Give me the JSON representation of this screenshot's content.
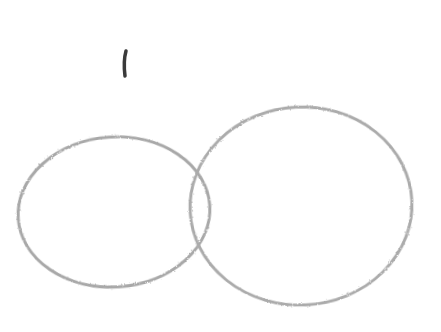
{
  "canvas": {
    "width": 441,
    "height": 332,
    "background": "#ffffff"
  },
  "sketch": {
    "stroke_color": "#a8a8a8",
    "mark_color": "#3a3a3a",
    "shapes": [
      {
        "type": "mark",
        "x1": 126,
        "y1": 51,
        "x2": 125,
        "y2": 76
      },
      {
        "type": "ellipse",
        "name": "left-oval",
        "cx": 114,
        "cy": 212,
        "rx": 96,
        "ry": 75
      },
      {
        "type": "ellipse",
        "name": "right-oval",
        "cx": 301,
        "cy": 206,
        "rx": 111,
        "ry": 99
      }
    ]
  }
}
